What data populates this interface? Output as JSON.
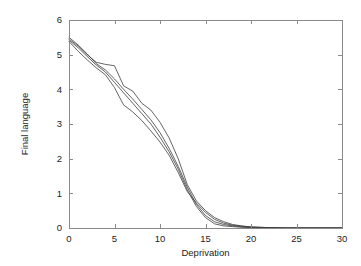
{
  "chart_data": {
    "type": "line",
    "title": "",
    "subtitle": "",
    "xlabel": "Deprivation",
    "ylabel": "Final language",
    "xlim": [
      0,
      30
    ],
    "ylim": [
      0,
      6
    ],
    "xticks": [
      0,
      5,
      10,
      15,
      20,
      25,
      30
    ],
    "yticks": [
      0,
      1,
      2,
      3,
      4,
      5,
      6
    ],
    "xtick_labels": [
      "0",
      "5",
      "10",
      "15",
      "20",
      "25",
      "30"
    ],
    "ytick_labels": [
      "0",
      "1",
      "2",
      "3",
      "4",
      "5",
      "6"
    ],
    "grid": false,
    "legend": false,
    "legend_position": "none",
    "line_color": "#3c3c3c",
    "frame_color": "#8a8a8a",
    "background_color": "#ffffff",
    "annotations": [],
    "series": [
      {
        "name": "curve-1",
        "x": [
          0,
          1,
          2,
          3,
          4,
          5,
          6,
          7,
          8,
          9,
          10,
          11,
          12,
          13,
          14,
          15,
          16,
          17,
          18,
          19,
          20,
          21,
          22,
          24,
          26,
          28,
          30
        ],
        "values": [
          5.45,
          5.25,
          5.0,
          4.78,
          4.72,
          4.68,
          4.1,
          3.95,
          3.6,
          3.4,
          3.05,
          2.6,
          2.0,
          1.25,
          0.78,
          0.5,
          0.3,
          0.18,
          0.1,
          0.06,
          0.03,
          0.02,
          0.01,
          0.0,
          0.0,
          0.0,
          0.0
        ]
      },
      {
        "name": "curve-2",
        "x": [
          0,
          1,
          2,
          3,
          4,
          5,
          6,
          7,
          8,
          9,
          10,
          11,
          12,
          13,
          14,
          15,
          16,
          17,
          18,
          19,
          20,
          21,
          22,
          24,
          26,
          28,
          30
        ],
        "values": [
          5.42,
          5.2,
          4.95,
          4.7,
          4.5,
          4.2,
          3.9,
          3.6,
          3.3,
          3.0,
          2.62,
          2.2,
          1.7,
          1.1,
          0.62,
          0.3,
          0.12,
          0.06,
          0.04,
          0.02,
          0.01,
          0.0,
          0.0,
          0.0,
          0.0,
          0.0,
          0.0
        ]
      },
      {
        "name": "curve-3",
        "x": [
          0,
          1,
          2,
          3,
          4,
          5,
          6,
          7,
          8,
          9,
          10,
          11,
          12,
          13,
          14,
          15,
          16,
          17,
          18,
          19,
          20,
          21,
          22,
          24,
          26,
          28,
          30
        ],
        "values": [
          5.38,
          5.1,
          4.85,
          4.62,
          4.42,
          4.05,
          3.55,
          3.35,
          3.1,
          2.8,
          2.48,
          2.1,
          1.6,
          1.05,
          0.72,
          0.45,
          0.25,
          0.14,
          0.08,
          0.05,
          0.03,
          0.02,
          0.01,
          0.0,
          0.0,
          0.0,
          0.0
        ]
      },
      {
        "name": "curve-4",
        "x": [
          0,
          1,
          2,
          3,
          4,
          5,
          6,
          7,
          8,
          9,
          10,
          11,
          12,
          13,
          14,
          15,
          16,
          17,
          18,
          19,
          20,
          21,
          22,
          24,
          26,
          28,
          30
        ],
        "values": [
          5.5,
          5.28,
          5.02,
          4.74,
          4.56,
          4.3,
          4.0,
          3.72,
          3.42,
          3.12,
          2.75,
          2.3,
          1.78,
          1.18,
          0.68,
          0.36,
          0.18,
          0.1,
          0.06,
          0.035,
          0.02,
          0.01,
          0.005,
          0.0,
          0.0,
          0.0,
          0.0
        ]
      }
    ]
  }
}
